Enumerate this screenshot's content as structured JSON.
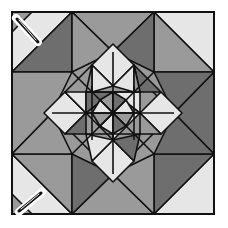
{
  "diagram": {
    "title": "Quilt block pattern",
    "type": "quilt-block",
    "colors": {
      "light": "#e6e6e6",
      "medium": "#9a9a9a",
      "dark": "#6e6e6e",
      "line": "#111111",
      "background": "#ffffff"
    },
    "icons": [
      {
        "name": "needle-icon",
        "position": "top-left"
      },
      {
        "name": "needle-icon",
        "position": "bottom-left"
      }
    ]
  }
}
